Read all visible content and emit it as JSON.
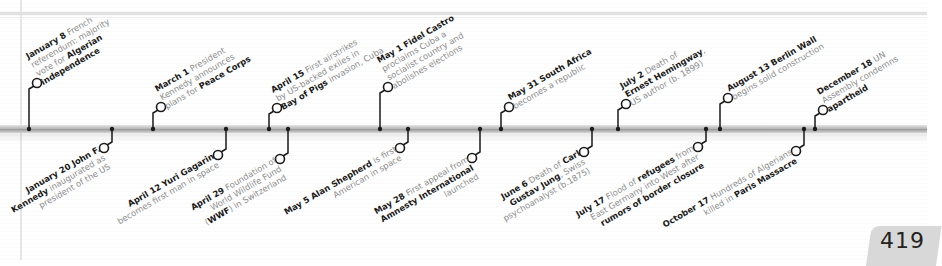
{
  "page_number": "419",
  "colors": {
    "axis": "#a8a8a8",
    "connector": "#1a1a1a",
    "text_bold": "#1a1a1a",
    "text_light": "#8a8a8a",
    "page_tab": "#d8d8d8"
  },
  "timeline": {
    "axis_y": 129,
    "events_above": [
      {
        "date": "January 8",
        "x": 29,
        "circle": [
          37,
          83
        ],
        "lines": [
          [
            {
              "t": "January 8",
              "b": true
            },
            {
              "t": " French",
              "b": false
            }
          ],
          [
            {
              "t": "referendum: majority",
              "b": false
            }
          ],
          [
            {
              "t": "vote for ",
              "b": false
            },
            {
              "t": "Algerian",
              "b": true
            }
          ],
          [
            {
              "t": "independence",
              "b": true
            }
          ]
        ]
      },
      {
        "date": "March 1",
        "x": 153,
        "circle": [
          161,
          107
        ],
        "lines": [
          [
            {
              "t": "March 1",
              "b": true
            },
            {
              "t": " President",
              "b": false
            }
          ],
          [
            {
              "t": "Kennedy announces",
              "b": false
            }
          ],
          [
            {
              "t": "plans for ",
              "b": false
            },
            {
              "t": "Peace Corps",
              "b": true
            }
          ]
        ]
      },
      {
        "date": "April 15",
        "x": 269,
        "circle": [
          277,
          108
        ],
        "lines": [
          [
            {
              "t": "April 15",
              "b": true
            },
            {
              "t": " First airstrikes",
              "b": false
            }
          ],
          [
            {
              "t": "by US-backed exiles in",
              "b": false
            }
          ],
          [
            {
              "t": "Bay of Pigs",
              "b": true
            },
            {
              "t": " invasion, Cuba",
              "b": false
            }
          ]
        ]
      },
      {
        "date": "May 1",
        "x": 380,
        "circle": [
          388,
          87
        ],
        "lines": [
          [
            {
              "t": "May 1",
              "b": true
            },
            {
              "t": " ",
              "b": false
            },
            {
              "t": "Fidel Castro",
              "b": true
            }
          ],
          [
            {
              "t": "proclaims Cuba a",
              "b": false
            }
          ],
          [
            {
              "t": "socialist country and",
              "b": false
            }
          ],
          [
            {
              "t": "abolishes elections",
              "b": false
            }
          ]
        ]
      },
      {
        "date": "May 31",
        "x": 501,
        "circle": [
          509,
          107
        ],
        "lines": [
          [
            {
              "t": "May 31",
              "b": true
            },
            {
              "t": " ",
              "b": false
            },
            {
              "t": "South Africa",
              "b": true
            }
          ],
          [
            {
              "t": "becomes a republic",
              "b": false
            }
          ]
        ]
      },
      {
        "date": "July 2",
        "x": 618,
        "circle": [
          626,
          104
        ],
        "lines": [
          [
            {
              "t": "July 2",
              "b": true
            },
            {
              "t": " Death of",
              "b": false
            }
          ],
          [
            {
              "t": "Ernest Hemingway",
              "b": true
            },
            {
              "t": ",",
              "b": false
            }
          ],
          [
            {
              "t": "US author (b. 1899)",
              "b": false
            }
          ]
        ]
      },
      {
        "date": "August 13",
        "x": 720,
        "circle": [
          728,
          98
        ],
        "lines": [
          [
            {
              "t": "August 13",
              "b": true
            },
            {
              "t": " ",
              "b": false
            },
            {
              "t": "Berlin Wall",
              "b": true
            }
          ],
          [
            {
              "t": "begins solid construction",
              "b": false
            }
          ]
        ]
      },
      {
        "date": "December 18",
        "x": 815,
        "circle": [
          823,
          110
        ],
        "lines": [
          [
            {
              "t": "December 18",
              "b": true
            },
            {
              "t": " UN",
              "b": false
            }
          ],
          [
            {
              "t": "Assembly condemns",
              "b": false
            }
          ],
          [
            {
              "t": "apartheid",
              "b": true
            }
          ]
        ]
      }
    ],
    "events_below": [
      {
        "date": "January 20",
        "x": 112,
        "circle": [
          104,
          148
        ],
        "lines": [
          [
            {
              "t": "January 20",
              "b": true
            },
            {
              "t": " ",
              "b": false
            },
            {
              "t": "John F.",
              "b": true
            }
          ],
          [
            {
              "t": "Kennedy",
              "b": true
            },
            {
              "t": " inaugurated as",
              "b": false
            }
          ],
          [
            {
              "t": "president of the US",
              "b": false
            }
          ]
        ]
      },
      {
        "date": "April 12",
        "x": 226,
        "circle": [
          218,
          155
        ],
        "lines": [
          [
            {
              "t": "April 12",
              "b": true
            },
            {
              "t": " ",
              "b": false
            },
            {
              "t": "Yuri Gagarin",
              "b": true
            }
          ],
          [
            {
              "t": "becomes first man in space",
              "b": false
            }
          ]
        ]
      },
      {
        "date": "April 29",
        "x": 288,
        "circle": [
          280,
          159
        ],
        "lines": [
          [
            {
              "t": "April 29",
              "b": true
            },
            {
              "t": " Foundation of",
              "b": false
            }
          ],
          [
            {
              "t": "World Wildlife Fund",
              "b": false
            }
          ],
          [
            {
              "t": "(",
              "b": false
            },
            {
              "t": "WWF",
              "b": true
            },
            {
              "t": ") in Switzerland",
              "b": false
            }
          ]
        ]
      },
      {
        "date": "May 5",
        "x": 408,
        "circle": [
          400,
          148
        ],
        "lines": [
          [
            {
              "t": "May 5",
              "b": true
            },
            {
              "t": " ",
              "b": false
            },
            {
              "t": "Alan Shepherd",
              "b": true
            },
            {
              "t": " is first",
              "b": false
            }
          ],
          [
            {
              "t": "American in space",
              "b": false
            }
          ]
        ]
      },
      {
        "date": "May 28",
        "x": 480,
        "circle": [
          472,
          158
        ],
        "lines": [
          [
            {
              "t": "May 28",
              "b": true
            },
            {
              "t": " First appeal from",
              "b": false
            }
          ],
          [
            {
              "t": "Amnesty International",
              "b": true
            }
          ],
          [
            {
              "t": "launched",
              "b": false
            }
          ]
        ]
      },
      {
        "date": "June 6",
        "x": 592,
        "circle": [
          584,
          152
        ],
        "lines": [
          [
            {
              "t": "June 6",
              "b": true
            },
            {
              "t": " Death of ",
              "b": false
            },
            {
              "t": "Carl",
              "b": true
            }
          ],
          [
            {
              "t": "Gustav Jung",
              "b": true
            },
            {
              "t": ", Swiss",
              "b": false
            }
          ],
          [
            {
              "t": "psychoanalyst (b.1875)",
              "b": false
            }
          ]
        ]
      },
      {
        "date": "July 17",
        "x": 706,
        "circle": [
          698,
          147
        ],
        "lines": [
          [
            {
              "t": "July 17",
              "b": true
            },
            {
              "t": " Flood of ",
              "b": false
            },
            {
              "t": "refugees",
              "b": true
            },
            {
              "t": " from",
              "b": false
            }
          ],
          [
            {
              "t": "East Germany into West after",
              "b": false
            }
          ],
          [
            {
              "t": "rumors of border closure",
              "b": true
            }
          ]
        ]
      },
      {
        "date": "October 17",
        "x": 804,
        "circle": [
          796,
          151
        ],
        "lines": [
          [
            {
              "t": "October 17",
              "b": true
            },
            {
              "t": " Hundreds of Algerians",
              "b": false
            }
          ],
          [
            {
              "t": "killed in ",
              "b": false
            },
            {
              "t": "Paris Massacre",
              "b": true
            }
          ]
        ]
      }
    ]
  }
}
